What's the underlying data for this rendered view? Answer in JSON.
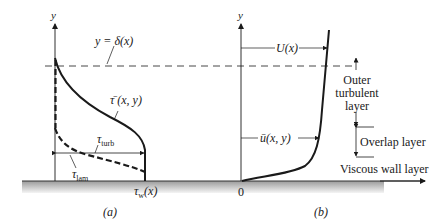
{
  "figure": {
    "panel_a": {
      "caption": "(a)",
      "axis_label_y": "y",
      "boundary_label": "y = δ(x)",
      "total_stress_label": "τ̄ (x, y)",
      "turb_stress_label": "τ",
      "turb_stress_sub": "turb",
      "lam_stress_label": "τ",
      "lam_stress_sub": "lam",
      "wall_stress_label": "τ",
      "wall_stress_sub": "w",
      "wall_stress_arg": "(x)"
    },
    "panel_b": {
      "caption": "(b)",
      "axis_label_y": "y",
      "origin_label": "0",
      "freestream_label": "U(x)",
      "mean_velocity_label": "ū(x, y)",
      "layers": {
        "outer": [
          "Outer",
          "turbulent",
          "layer"
        ],
        "overlap": "Overlap layer",
        "viscous": "Viscous wall layer"
      }
    },
    "colors": {
      "line": "#1a1a1a",
      "wall_shade_top": "#9a9a9a",
      "wall_shade_bottom": "#f2f2f2"
    }
  }
}
